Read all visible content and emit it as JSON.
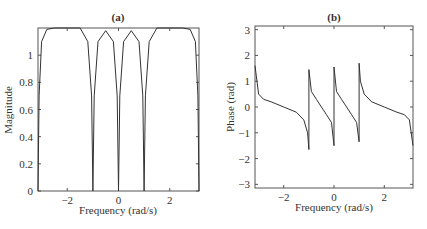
{
  "chart_data": [
    {
      "type": "line",
      "title": "(a)",
      "xlabel": "Frequency (rad/s)",
      "ylabel": "Magnitude",
      "xlim": [
        -3.14159,
        3.14159
      ],
      "ylim": [
        0,
        1.2
      ],
      "xticks": [
        -2,
        0,
        2
      ],
      "yticks": [
        0,
        0.2,
        0.4,
        0.6,
        0.8,
        1
      ],
      "grid": false,
      "description": "Magnitude response with zeros at -1, 0, 1 rad/s; flat tops ~1.2 for |w|>1, lobes ~1.18 peaking near ±0.5; drops to 0 at ±pi",
      "x": [
        -3.14,
        -3.1,
        -3.0,
        -2.8,
        -2.5,
        -2.0,
        -1.5,
        -1.2,
        -1.05,
        -1.0,
        -0.95,
        -0.8,
        -0.5,
        -0.2,
        -0.05,
        0,
        0.05,
        0.2,
        0.5,
        0.8,
        0.95,
        1.0,
        1.05,
        1.2,
        1.5,
        2.0,
        2.5,
        2.8,
        3.0,
        3.1,
        3.14
      ],
      "values": [
        0.0,
        0.7,
        1.1,
        1.19,
        1.2,
        1.2,
        1.2,
        1.1,
        0.7,
        0.0,
        0.7,
        1.1,
        1.18,
        1.1,
        0.7,
        0.0,
        0.7,
        1.1,
        1.18,
        1.1,
        0.7,
        0.0,
        0.7,
        1.1,
        1.2,
        1.2,
        1.2,
        1.19,
        1.1,
        0.7,
        0.0
      ]
    },
    {
      "type": "line",
      "title": "(b)",
      "xlabel": "Frequency (rad/s)",
      "ylabel": "Phase (rad)",
      "xlim": [
        -3.14159,
        3.14159
      ],
      "ylim": [
        -3.14159,
        3.14159
      ],
      "xticks": [
        -2,
        0,
        2
      ],
      "yticks": [
        -3,
        -2,
        -1,
        0,
        1,
        2,
        3
      ],
      "grid": false,
      "description": "Phase response decreasing in each band with jumps at -1, 0, 1 rad/s",
      "x": [
        -3.14,
        -3.0,
        -2.8,
        -2.5,
        -2.0,
        -1.5,
        -1.2,
        -1.05,
        -1.0,
        -1.0,
        -0.9,
        -0.7,
        -0.5,
        -0.3,
        -0.1,
        0.0,
        0.0,
        0.1,
        0.3,
        0.5,
        0.7,
        0.9,
        1.0,
        1.0,
        1.05,
        1.2,
        1.5,
        2.0,
        2.5,
        2.8,
        3.0,
        3.14
      ],
      "values": [
        1.6,
        0.5,
        0.3,
        0.2,
        0.0,
        -0.2,
        -0.5,
        -1.0,
        -1.65,
        1.45,
        0.6,
        0.3,
        0.0,
        -0.3,
        -0.6,
        -1.5,
        1.55,
        0.6,
        0.3,
        0.0,
        -0.3,
        -0.6,
        -1.35,
        1.7,
        1.0,
        0.5,
        0.2,
        0.0,
        -0.2,
        -0.3,
        -0.5,
        -1.5
      ]
    }
  ],
  "panels": {
    "a": {
      "title": "(a)",
      "xlabel": "Frequency (rad/s)",
      "ylabel": "Magnitude",
      "xtick_labels": [
        "−2",
        "0",
        "2"
      ],
      "ytick_labels": [
        "0",
        "0.2",
        "0.4",
        "0.6",
        "0.8",
        "1"
      ]
    },
    "b": {
      "title": "(b)",
      "xlabel": "Frequency (rad/s)",
      "ylabel": "Phase (rad)",
      "xtick_labels": [
        "−2",
        "0",
        "2"
      ],
      "ytick_labels": [
        "−3",
        "−2",
        "−1",
        "0",
        "1",
        "2",
        "3"
      ]
    }
  }
}
